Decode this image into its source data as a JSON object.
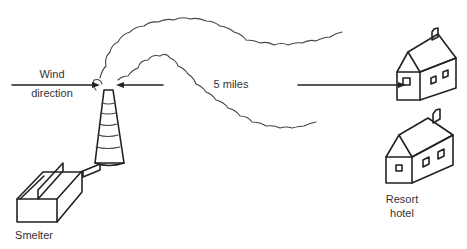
{
  "figure": {
    "labels": {
      "wind_direction_line1": "Wind",
      "wind_direction_line2": "direction",
      "distance": "5 miles",
      "smelter": "Smelter",
      "resort_line1": "Resort",
      "resort_line2": "hotel"
    },
    "elements": [
      "smelter",
      "smokestack",
      "smoke-plume",
      "wind-arrow",
      "distance-arrow",
      "house-upper",
      "resort-hotel"
    ],
    "colors": {
      "ink": "#222222",
      "background": "#ffffff"
    }
  }
}
